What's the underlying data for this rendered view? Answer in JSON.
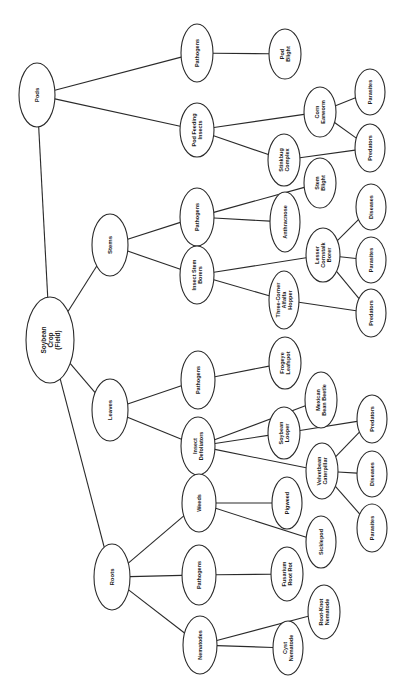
{
  "diagram": {
    "orientation": "rotated-90-ccw",
    "colors": {
      "line": "#2a2a2a",
      "text": "#1a1a1a",
      "background": "#ffffff"
    },
    "nodes": [
      {
        "id": "root",
        "lines": [
          "Soybean",
          "Crop",
          "(Field)"
        ],
        "cx": 50,
        "cy": 340,
        "rx": 24,
        "ry": 43,
        "fs": 6.5
      },
      {
        "id": "pods",
        "lines": [
          "Pods"
        ],
        "cx": 28,
        "cy": 95,
        "rx": 0,
        "ry": 0,
        "fs": 6
      },
      {
        "id": "stems",
        "lines": [
          "Stems"
        ],
        "cx": 110,
        "cy": 245,
        "rx": 18,
        "ry": 31,
        "fs": 6
      },
      {
        "id": "leaves",
        "lines": [
          "Leaves"
        ],
        "cx": 110,
        "cy": 410,
        "rx": 18,
        "ry": 31,
        "fs": 6
      },
      {
        "id": "roots",
        "lines": [
          "Roots"
        ],
        "cx": 112,
        "cy": 577,
        "rx": 18,
        "ry": 33,
        "fs": 6
      },
      {
        "id": "pods-pathogens",
        "lines": [
          "Pathogens"
        ],
        "cx": 197,
        "cy": 53,
        "rx": 16,
        "ry": 29,
        "fs": 5.5
      },
      {
        "id": "pod-feeding",
        "lines": [
          "Pod Feeding",
          "Insects"
        ],
        "cx": 197,
        "cy": 130,
        "rx": 17,
        "ry": 27,
        "fs": 5.5
      },
      {
        "id": "pod-blight",
        "lines": [
          "Pod",
          "Blight"
        ],
        "cx": 285,
        "cy": 54,
        "rx": 16,
        "ry": 25,
        "fs": 5.5
      },
      {
        "id": "stinkbug",
        "lines": [
          "Stinkbug",
          "Complex"
        ],
        "cx": 284,
        "cy": 160,
        "rx": 16,
        "ry": 26,
        "fs": 5.5
      },
      {
        "id": "corn-earworm",
        "lines": [
          "Corn",
          "Earworm"
        ],
        "cx": 320,
        "cy": 112,
        "rx": 16,
        "ry": 25,
        "fs": 5.5
      },
      {
        "id": "pod-parasites",
        "lines": [
          "Parasites"
        ],
        "cx": 370,
        "cy": 92,
        "rx": 15,
        "ry": 23,
        "fs": 5.5
      },
      {
        "id": "pod-predators",
        "lines": [
          "Predators"
        ],
        "cx": 370,
        "cy": 148,
        "rx": 15,
        "ry": 24,
        "fs": 5.5
      },
      {
        "id": "stems-pathogens",
        "lines": [
          "Pathogens"
        ],
        "cx": 197,
        "cy": 217,
        "rx": 17,
        "ry": 29,
        "fs": 5.5
      },
      {
        "id": "insect-stem-borers",
        "lines": [
          "Insect Stem",
          "Borers"
        ],
        "cx": 197,
        "cy": 275,
        "rx": 17,
        "ry": 29,
        "fs": 5.5
      },
      {
        "id": "anthracnose",
        "lines": [
          "Anthracnose"
        ],
        "cx": 285,
        "cy": 222,
        "rx": 15,
        "ry": 30,
        "fs": 5.5
      },
      {
        "id": "stem-blight",
        "lines": [
          "Stem",
          "Blight"
        ],
        "cx": 320,
        "cy": 183,
        "rx": 16,
        "ry": 25,
        "fs": 5.5
      },
      {
        "id": "lesser-cornstalk",
        "lines": [
          "Lesser",
          "Cornstalk",
          "Borer"
        ],
        "cx": 323,
        "cy": 255,
        "rx": 17,
        "ry": 27,
        "fs": 5.5
      },
      {
        "id": "three-corner",
        "lines": [
          "Three-Corner",
          "Alfalfa",
          "Hopper"
        ],
        "cx": 284,
        "cy": 300,
        "rx": 15,
        "ry": 29,
        "fs": 5.5
      },
      {
        "id": "stem-diseases",
        "lines": [
          "Diseases"
        ],
        "cx": 371,
        "cy": 207,
        "rx": 15,
        "ry": 23,
        "fs": 5.5
      },
      {
        "id": "stem-parasites",
        "lines": [
          "Parasites"
        ],
        "cx": 371,
        "cy": 260,
        "rx": 15,
        "ry": 23,
        "fs": 5.5
      },
      {
        "id": "stem-predators",
        "lines": [
          "Predators"
        ],
        "cx": 371,
        "cy": 313,
        "rx": 15,
        "ry": 24,
        "fs": 5.5
      },
      {
        "id": "leaves-pathogens",
        "lines": [
          "Pathogens"
        ],
        "cx": 198,
        "cy": 380,
        "rx": 17,
        "ry": 29,
        "fs": 5.5
      },
      {
        "id": "insect-defoliators",
        "lines": [
          "Insect",
          "Defoliators"
        ],
        "cx": 198,
        "cy": 446,
        "rx": 17,
        "ry": 29,
        "fs": 5.5
      },
      {
        "id": "frogeye",
        "lines": [
          "Frogeye",
          "Leafspot"
        ],
        "cx": 285,
        "cy": 363,
        "rx": 16,
        "ry": 26,
        "fs": 5.5
      },
      {
        "id": "mexican-bean-beetle",
        "lines": [
          "Mexican",
          "Bean Beetle"
        ],
        "cx": 321,
        "cy": 400,
        "rx": 16,
        "ry": 28,
        "fs": 5.5
      },
      {
        "id": "soybean-looper",
        "lines": [
          "Soybean",
          "Looper"
        ],
        "cx": 284,
        "cy": 433,
        "rx": 16,
        "ry": 26,
        "fs": 5.5
      },
      {
        "id": "velvetbean",
        "lines": [
          "Velvetbean",
          "Caterpillar"
        ],
        "cx": 322,
        "cy": 471,
        "rx": 16,
        "ry": 28,
        "fs": 5.5
      },
      {
        "id": "leaf-predators",
        "lines": [
          "Predators"
        ],
        "cx": 372,
        "cy": 419,
        "rx": 15,
        "ry": 24,
        "fs": 5.5
      },
      {
        "id": "leaf-diseases",
        "lines": [
          "Diseases"
        ],
        "cx": 372,
        "cy": 474,
        "rx": 15,
        "ry": 23,
        "fs": 5.5
      },
      {
        "id": "leaf-parasites",
        "lines": [
          "Parasites"
        ],
        "cx": 372,
        "cy": 528,
        "rx": 15,
        "ry": 24,
        "fs": 5.5
      },
      {
        "id": "weeds",
        "lines": [
          "Weeds"
        ],
        "cx": 199,
        "cy": 503,
        "rx": 17,
        "ry": 29,
        "fs": 5.5
      },
      {
        "id": "roots-pathogens",
        "lines": [
          "Pathogens"
        ],
        "cx": 199,
        "cy": 575,
        "rx": 17,
        "ry": 30,
        "fs": 5.5
      },
      {
        "id": "nematodes",
        "lines": [
          "Nematodes"
        ],
        "cx": 200,
        "cy": 645,
        "rx": 17,
        "ry": 29,
        "fs": 5.5
      },
      {
        "id": "pigweed",
        "lines": [
          "Pigweed"
        ],
        "cx": 287,
        "cy": 503,
        "rx": 15,
        "ry": 26,
        "fs": 5.5
      },
      {
        "id": "sicklepod",
        "lines": [
          "Sicklepod"
        ],
        "cx": 321,
        "cy": 542,
        "rx": 15,
        "ry": 26,
        "fs": 5.5
      },
      {
        "id": "fusarium",
        "lines": [
          "Fusarium",
          "Root Rot"
        ],
        "cx": 287,
        "cy": 574,
        "rx": 16,
        "ry": 27,
        "fs": 5.5
      },
      {
        "id": "root-knot",
        "lines": [
          "Root-Knot",
          "Nematode"
        ],
        "cx": 324,
        "cy": 612,
        "rx": 16,
        "ry": 27,
        "fs": 5.5
      },
      {
        "id": "cyst",
        "lines": [
          "Cyst",
          "Nematode"
        ],
        "cx": 288,
        "cy": 648,
        "rx": 15,
        "ry": 27,
        "fs": 5.5
      }
    ],
    "edges": [
      [
        "root",
        "pods"
      ],
      [
        "root",
        "stems"
      ],
      [
        "root",
        "leaves"
      ],
      [
        "root",
        "roots"
      ],
      [
        "pods",
        "pods-pathogens"
      ],
      [
        "pods",
        "pod-feeding"
      ],
      [
        "pods-pathogens",
        "pod-blight"
      ],
      [
        "pod-feeding",
        "corn-earworm"
      ],
      [
        "pod-feeding",
        "stinkbug"
      ],
      [
        "corn-earworm",
        "pod-parasites"
      ],
      [
        "corn-earworm",
        "pod-predators"
      ],
      [
        "stinkbug",
        "pod-predators"
      ],
      [
        "stems",
        "stems-pathogens"
      ],
      [
        "stems",
        "insect-stem-borers"
      ],
      [
        "stems-pathogens",
        "stem-blight"
      ],
      [
        "stems-pathogens",
        "anthracnose"
      ],
      [
        "insect-stem-borers",
        "lesser-cornstalk"
      ],
      [
        "insect-stem-borers",
        "three-corner"
      ],
      [
        "lesser-cornstalk",
        "stem-diseases"
      ],
      [
        "lesser-cornstalk",
        "stem-parasites"
      ],
      [
        "lesser-cornstalk",
        "stem-predators"
      ],
      [
        "three-corner",
        "stem-predators"
      ],
      [
        "leaves",
        "leaves-pathogens"
      ],
      [
        "leaves",
        "insect-defoliators"
      ],
      [
        "leaves-pathogens",
        "frogeye"
      ],
      [
        "insect-defoliators",
        "mexican-bean-beetle"
      ],
      [
        "insect-defoliators",
        "soybean-looper"
      ],
      [
        "insect-defoliators",
        "velvetbean"
      ],
      [
        "soybean-looper",
        "leaf-predators"
      ],
      [
        "velvetbean",
        "leaf-predators"
      ],
      [
        "velvetbean",
        "leaf-diseases"
      ],
      [
        "velvetbean",
        "leaf-parasites"
      ],
      [
        "roots",
        "weeds"
      ],
      [
        "roots",
        "roots-pathogens"
      ],
      [
        "roots",
        "nematodes"
      ],
      [
        "weeds",
        "pigweed"
      ],
      [
        "weeds",
        "sicklepod"
      ],
      [
        "roots-pathogens",
        "fusarium"
      ],
      [
        "nematodes",
        "root-knot"
      ],
      [
        "nematodes",
        "cyst"
      ]
    ]
  }
}
